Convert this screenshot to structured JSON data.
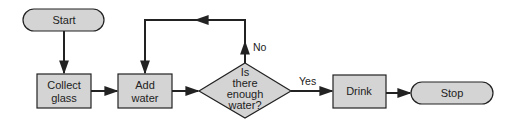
{
  "diagram": {
    "type": "flowchart",
    "colors": {
      "fill": "#d4d4d4",
      "stroke": "#222222",
      "background": "#ffffff"
    },
    "nodes": {
      "start": {
        "label": "Start",
        "shape": "terminator"
      },
      "collect": {
        "line1": "Collect",
        "line2": "glass",
        "shape": "process"
      },
      "add": {
        "line1": "Add",
        "line2": "water",
        "shape": "process"
      },
      "decision": {
        "line1": "Is",
        "line2": "there",
        "line3": "enough",
        "line4": "water?",
        "shape": "decision"
      },
      "drink": {
        "label": "Drink",
        "shape": "process"
      },
      "stop": {
        "label": "Stop",
        "shape": "terminator"
      }
    },
    "edges": {
      "no_label": "No",
      "yes_label": "Yes"
    },
    "edge_list": [
      {
        "from": "Start",
        "to": "Collect glass"
      },
      {
        "from": "Collect glass",
        "to": "Add water"
      },
      {
        "from": "Add water",
        "to": "Is there enough water?"
      },
      {
        "from": "Is there enough water?",
        "to": "Add water",
        "label": "No"
      },
      {
        "from": "Is there enough water?",
        "to": "Drink",
        "label": "Yes"
      },
      {
        "from": "Drink",
        "to": "Stop"
      }
    ]
  }
}
